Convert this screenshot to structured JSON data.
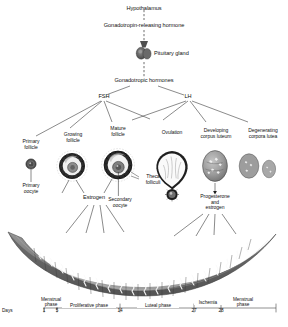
{
  "figure": {
    "title_top": "Hypothalamus",
    "hormone_chain": [
      "Hypothalamus",
      "Gonadotropin-releasing hormone",
      "Pituitary gland",
      "Gonadotropic hormones"
    ]
  },
  "nodes": {
    "hypothalamus": "Hypothalamus",
    "gnrh": "Gonadotropin-releasing hormone",
    "pituitary": "Pituitary gland",
    "gonadotropic": "Gonadotropic hormones",
    "fsh": "FSH",
    "lh": "LH",
    "estrogen": "Estrogen",
    "progesterone_estrogen": "Progesterone\nand\nestrogen"
  },
  "ovary_stages": [
    {
      "id": "primary-follicle",
      "label": "Primary\nfollicle"
    },
    {
      "id": "growing-follicle",
      "label": "Growing\nfollicle"
    },
    {
      "id": "mature-follicle",
      "label": "Mature\nfollicle"
    },
    {
      "id": "ovulation",
      "label": "Ovulation"
    },
    {
      "id": "developing-corpus-luteum",
      "label": "Developing\ncorpus luteum"
    },
    {
      "id": "degenerating-corpora-lutea",
      "label": "Degenerating\ncorpora lutea"
    }
  ],
  "cell_labels": {
    "primary_oocyte": "Primary\noocyte",
    "secondary_oocyte": "Secondary\noocyte",
    "theca_folliculi": "Theca\nfolliculi"
  },
  "timeline": {
    "days_label": "Days",
    "ticks": [
      "1",
      "5",
      "14",
      "27",
      "28"
    ],
    "phases": [
      {
        "id": "menstrual-phase-start",
        "label": "Menstrual\nphase"
      },
      {
        "id": "proliferative-phase",
        "label": "Proliferative phase"
      },
      {
        "id": "luteal-phase",
        "label": "Luteal phase"
      },
      {
        "id": "ischemia",
        "label": "Ischemia"
      },
      {
        "id": "menstrual-phase-end",
        "label": "Menstrual\nphase"
      }
    ]
  },
  "colors": {
    "line": "#2b2b2b",
    "text": "#111111",
    "tissue_dark": "#5d5d5d",
    "tissue_mid": "#8e8e8e",
    "tissue_light": "#b9b9b9",
    "background": "#ffffff"
  }
}
